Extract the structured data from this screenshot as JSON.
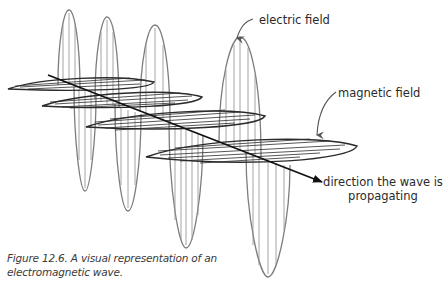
{
  "figure": {
    "caption_line1": "Figure 12.6. A visual representation of an",
    "caption_line2": "electromagnetic wave."
  },
  "labels": {
    "electric_field": "electric field",
    "magnetic_field": "magnetic field",
    "direction_line1": "direction the wave is",
    "direction_line2": "propagating"
  },
  "colors": {
    "electric_field": "#7a7a7a",
    "magnetic_field": "#2b2b2b",
    "axis": "#111111",
    "text": "#2a2a2a"
  },
  "diagram": {
    "axis": {
      "x1": 48,
      "y1": 75,
      "x2": 322,
      "y2": 182
    },
    "electric_lobes": [
      {
        "cx": 69,
        "peak": 10,
        "half": 11
      },
      {
        "cx": 85,
        "trough": 191,
        "half": 11
      },
      {
        "cx": 107,
        "peak": 17,
        "half": 12
      },
      {
        "cx": 128,
        "trough": 211,
        "half": 13
      },
      {
        "cx": 155,
        "peak": 25,
        "half": 15
      },
      {
        "cx": 186,
        "trough": 248,
        "half": 17
      },
      {
        "cx": 240,
        "peak": 37,
        "half": 21
      },
      {
        "cx": 268,
        "trough": 277,
        "half": 22
      }
    ],
    "magnetic_loops": [
      {
        "lx": 8,
        "ly": 89,
        "rx": 154,
        "ry": 82
      },
      {
        "lx": 42,
        "ly": 106,
        "rx": 202,
        "ry": 97
      },
      {
        "lx": 86,
        "ly": 127,
        "rx": 265,
        "ry": 116
      },
      {
        "lx": 146,
        "ly": 157,
        "rx": 357,
        "ry": 146
      }
    ]
  }
}
